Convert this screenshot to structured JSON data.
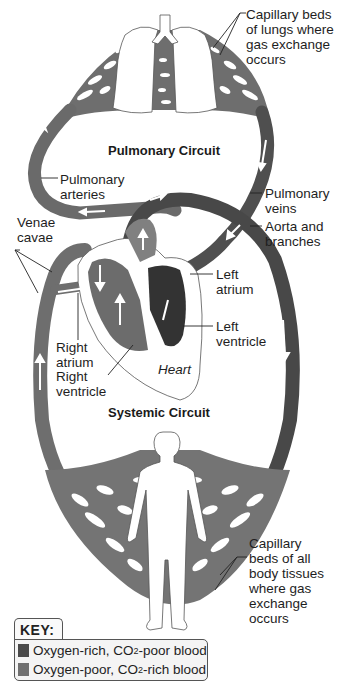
{
  "figure": {
    "titles": {
      "pulmonary_circuit": "Pulmonary Circuit",
      "systemic_circuit": "Systemic Circuit",
      "heart": "Heart"
    },
    "labels": {
      "capillary_lungs": "Capillary beds\nof lungs where\ngas exchange\noccurs",
      "pulmonary_arteries": "Pulmonary\narteries",
      "pulmonary_veins": "Pulmonary\nveins",
      "venae_cavae": "Venae\ncavae",
      "aorta": "Aorta and\nbranches",
      "left_atrium": "Left\natrium",
      "left_ventricle": "Left\nventricle",
      "right_atrium": "Right\natrium",
      "right_ventricle": "Right\nventricle",
      "capillary_body": "Capillary\nbeds of all\nbody tissues\nwhere gas\nexchange\noccurs"
    },
    "key": {
      "title": "KEY:",
      "items": [
        {
          "label_prefix": "Oxygen-rich, CO",
          "subscript": "2",
          "label_suffix": "-poor blood",
          "color": "#4a4a4a"
        },
        {
          "label_prefix": "Oxygen-poor, CO",
          "subscript": "2",
          "label_suffix": "-rich blood",
          "color": "#707070"
        }
      ]
    },
    "colors": {
      "oxygen_rich": "#4a4a4a",
      "oxygen_poor": "#707070",
      "vessel_highlight": "#9a9a9a",
      "arrow": "#ffffff"
    }
  }
}
